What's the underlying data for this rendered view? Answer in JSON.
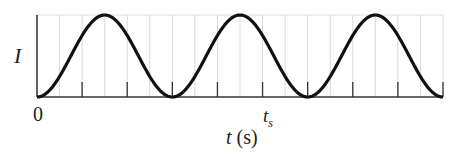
{
  "chart_data": {
    "type": "line",
    "title": "",
    "xlabel_var": "t",
    "xlabel_unit": "(s)",
    "ylabel": "I",
    "x_tick_labels": [
      {
        "pos": 0,
        "label": "0"
      },
      {
        "pos": 5,
        "label": "t",
        "subscript": "s"
      }
    ],
    "x_range": [
      0,
      9
    ],
    "y_range": [
      0,
      1
    ],
    "major_tick_count": 9,
    "minor_grid": true,
    "series": [
      {
        "name": "I(t)",
        "function": "(1 - cos(2*pi*t/3)) / 2",
        "period": 3,
        "x": [
          0,
          0.75,
          1.5,
          2.25,
          3,
          3.75,
          4.5,
          5.25,
          6,
          6.75,
          7.5,
          8.25,
          9
        ],
        "values": [
          0,
          0.5,
          1,
          0.5,
          0,
          0.5,
          1,
          0.5,
          0,
          0.5,
          1,
          0.5,
          0
        ]
      }
    ]
  },
  "labels": {
    "y": "I",
    "zero": "0",
    "ts_main": "t",
    "ts_sub": "s",
    "x_var": "t",
    "x_unit": " (s)"
  }
}
